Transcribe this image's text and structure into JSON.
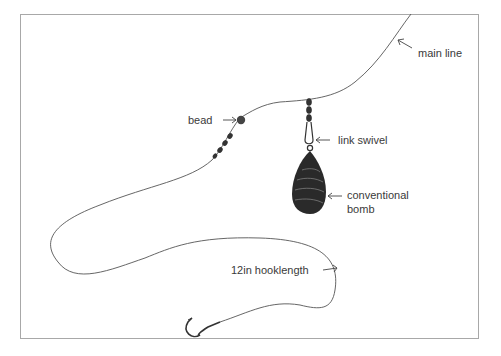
{
  "diagram": {
    "labels": {
      "main_line": "main line",
      "bead": "bead",
      "link_swivel": "link swivel",
      "bomb_line1": "conventional",
      "bomb_line2": "bomb",
      "hooklength": "12in hooklength"
    },
    "colors": {
      "line": "#555555",
      "frame": "#a8a8a8",
      "text": "#3a3a3a",
      "lead": "#222222"
    }
  }
}
